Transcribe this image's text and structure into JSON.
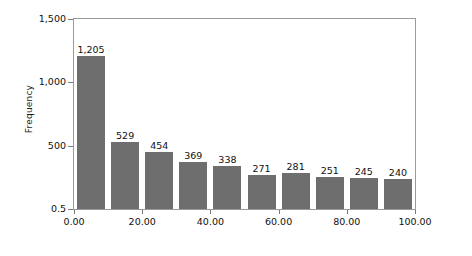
{
  "chart_data": {
    "type": "bar",
    "title": "",
    "subtitle": "",
    "xlabel": "",
    "ylabel": "Frequency",
    "categories": [
      "0.00",
      "10.00",
      "20.00",
      "30.00",
      "40.00",
      "50.00",
      "60.00",
      "70.00",
      "80.00",
      "90.00"
    ],
    "values": [
      1205,
      529,
      454,
      369,
      338,
      271,
      281,
      251,
      245,
      240
    ],
    "value_labels": [
      "1,205",
      "529",
      "454",
      "369",
      "338",
      "271",
      "281",
      "251",
      "245",
      "240"
    ],
    "bar_color": "#6e6e6e",
    "ylim": [
      0.5,
      1500
    ],
    "xlim": [
      0,
      100
    ],
    "grid": false,
    "legend": false,
    "y_ticks": [
      {
        "value": 1500,
        "label": "1,500"
      },
      {
        "value": 1000,
        "label": "1,000"
      },
      {
        "value": 500,
        "label": "500"
      },
      {
        "value": 0.5,
        "label": "0.5"
      }
    ],
    "x_ticks": [
      {
        "value": 0,
        "label": "0.00"
      },
      {
        "value": 20,
        "label": "20.00"
      },
      {
        "value": 40,
        "label": "40.00"
      },
      {
        "value": 60,
        "label": "60.00"
      },
      {
        "value": 80,
        "label": "80.00"
      },
      {
        "value": 100,
        "label": "100.00"
      }
    ],
    "bin_width": 10,
    "axis_color": "#9a9a9a",
    "text_color": "#111111",
    "background": "#ffffff"
  }
}
